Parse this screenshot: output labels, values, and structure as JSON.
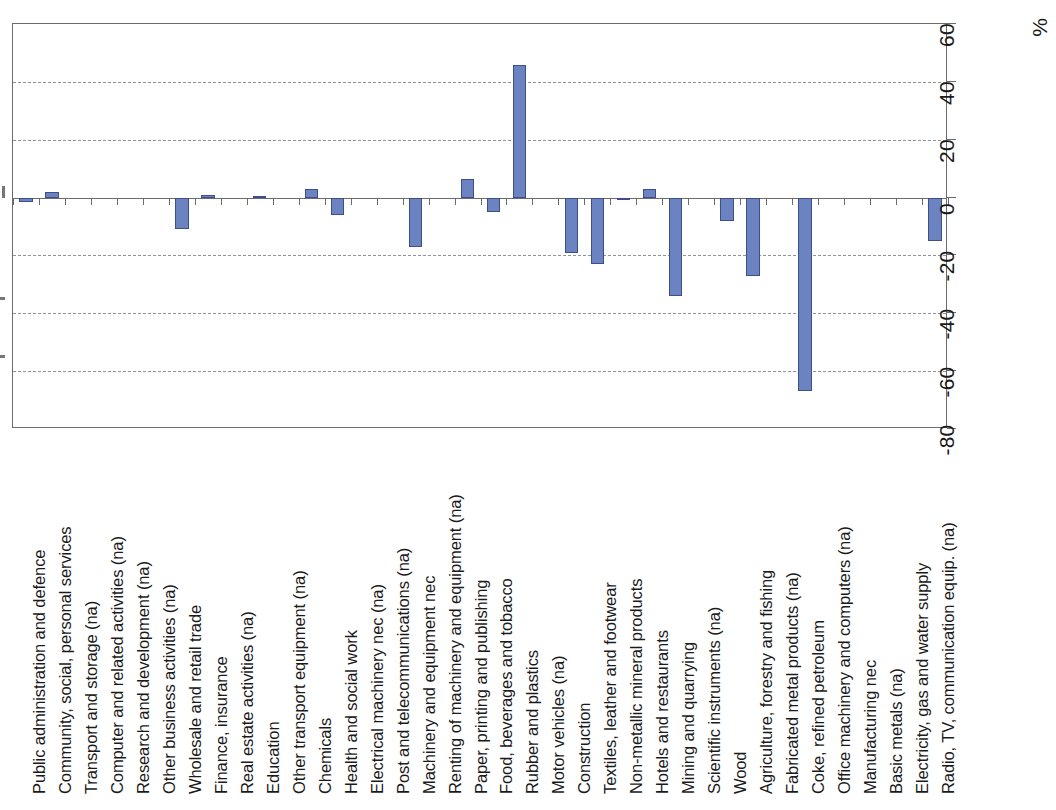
{
  "chart_data": {
    "type": "bar",
    "title": "",
    "subtitle": "",
    "xlabel": "",
    "ylabel": "%",
    "unit_label": "%",
    "ylim": [
      -80,
      60
    ],
    "yticks": [
      60,
      40,
      20,
      0,
      -20,
      -40,
      -60,
      -80
    ],
    "ytick_labels": [
      "60",
      "40",
      "20",
      "0",
      "-20",
      "-40",
      "-60",
      "-80"
    ],
    "gridlines": [
      40,
      20,
      -20,
      -40,
      -60
    ],
    "grid": true,
    "legend": null,
    "legend_position": "none",
    "bar_color": "#6b83c0",
    "bar_edge_color": "#3d4f86",
    "categories": [
      "Public administration and defence",
      "Community, social, personal services",
      "Transport and storage (na)",
      "Computer and related activities (na)",
      "Research and development (na)",
      "Other business activities (na)",
      "Wholesale and retail trade",
      "Finance, insurance",
      "Real estate activities (na)",
      "Education",
      "Other transport equipment (na)",
      "Chemicals",
      "Health and social work",
      "Electrical machinery nec (na)",
      "Post and telecommunications (na)",
      "Machinery and equipment nec",
      "Renting of machinery and equipment (na)",
      "Paper, printing and publishing",
      "Food, beverages and tobacco",
      "Rubber and plastics",
      "Motor vehicles (na)",
      "Construction",
      "Textiles, leather and footwear",
      "Non-metallic mineral products",
      "Hotels and restaurants",
      "Mining and quarrying",
      "Scientific instruments (na)",
      "Wood",
      "Agriculture, forestry and fishing",
      "Fabricated metal products (na)",
      "Coke, refined petroleum",
      "Office machinery and computers (na)",
      "Manufacturing nec",
      "Basic metals (na)",
      "Electricity, gas and water supply",
      "Radio, TV, communication equip. (na)"
    ],
    "values": [
      -1.5,
      2.0,
      0.0,
      0.0,
      0.0,
      0.0,
      -11.0,
      0.8,
      0.0,
      0.6,
      0.0,
      3.0,
      -6.0,
      0.0,
      0.0,
      -17.0,
      0.0,
      6.5,
      -5.0,
      46.0,
      0.0,
      -19.0,
      -23.0,
      -0.8,
      3.0,
      -34.0,
      0.0,
      -8.0,
      -27.0,
      0.0,
      -67.0,
      0.0,
      0.0,
      0.0,
      0.0,
      -15.0
    ]
  }
}
